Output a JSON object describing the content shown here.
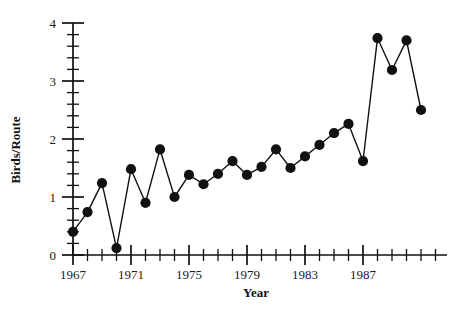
{
  "chart_data": {
    "type": "line",
    "title": "",
    "subtitle": "",
    "xlabel": "Year",
    "ylabel": "Birds/Route",
    "x": [
      1967,
      1968,
      1969,
      1970,
      1971,
      1972,
      1973,
      1974,
      1975,
      1976,
      1977,
      1978,
      1979,
      1980,
      1981,
      1982,
      1983,
      1984,
      1985,
      1986,
      1987,
      1988,
      1989,
      1990
    ],
    "values": [
      0.4,
      0.74,
      1.24,
      0.12,
      1.48,
      0.9,
      1.82,
      1.0,
      1.38,
      1.22,
      1.4,
      1.62,
      1.38,
      1.52,
      1.82,
      1.5,
      1.7,
      1.9,
      2.1,
      2.26,
      1.62,
      3.74,
      3.19,
      3.7
    ],
    "series": [
      {
        "name": "Birds per Route",
        "values": [
          0.4,
          0.74,
          1.24,
          0.12,
          1.48,
          0.9,
          1.82,
          1.0,
          1.38,
          1.22,
          1.4,
          1.62,
          1.38,
          1.52,
          1.82,
          1.5,
          1.7,
          1.9,
          2.1,
          2.26,
          1.62,
          3.74,
          3.19,
          3.7
        ]
      }
    ],
    "points": [
      {
        "x": 1967,
        "y": 0.4
      },
      {
        "x": 1968,
        "y": 0.74
      },
      {
        "x": 1969,
        "y": 1.24
      },
      {
        "x": 1970,
        "y": 0.12
      },
      {
        "x": 1971,
        "y": 1.48
      },
      {
        "x": 1972,
        "y": 0.9
      },
      {
        "x": 1973,
        "y": 1.82
      },
      {
        "x": 1974,
        "y": 1.0
      },
      {
        "x": 1975,
        "y": 1.38
      },
      {
        "x": 1976,
        "y": 1.22
      },
      {
        "x": 1977,
        "y": 1.4
      },
      {
        "x": 1978,
        "y": 1.62
      },
      {
        "x": 1979,
        "y": 1.38
      },
      {
        "x": 1980,
        "y": 1.52
      },
      {
        "x": 1981,
        "y": 1.82
      },
      {
        "x": 1982,
        "y": 1.5
      },
      {
        "x": 1983,
        "y": 1.7
      },
      {
        "x": 1984,
        "y": 1.9
      },
      {
        "x": 1985,
        "y": 2.1
      },
      {
        "x": 1986,
        "y": 2.26
      },
      {
        "x": 1987,
        "y": 1.62
      },
      {
        "x": 1988,
        "y": 3.74
      },
      {
        "x": 1989,
        "y": 3.19
      },
      {
        "x": 1990,
        "y": 3.7
      },
      {
        "x": 1991,
        "y": 2.5
      }
    ],
    "xlim": [
      1966.2,
      1991.8
    ],
    "ylim": [
      0,
      4
    ],
    "x_major_ticks": [
      1967,
      1971,
      1975,
      1979,
      1983,
      1987
    ],
    "x_major_tick_labels": [
      "1967",
      "1971",
      "1975",
      "1979",
      "1983",
      "1987"
    ],
    "x_minor_tick_step": 1,
    "y_major_ticks": [
      0,
      1,
      2,
      3,
      4
    ],
    "y_major_tick_labels": [
      "0",
      "1",
      "2",
      "3",
      "4"
    ],
    "y_minor_tick_step": 0.2,
    "grid": false,
    "legend": false,
    "legend_position": "none",
    "marker": "filled-circle",
    "marker_color": "#111111",
    "line_color": "#111111",
    "background_color": "#ffffff"
  },
  "figure": {
    "ylabel": "Birds/Route",
    "xlabel": "Year"
  }
}
